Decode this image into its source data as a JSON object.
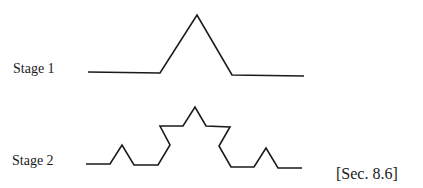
{
  "figure": {
    "stage1_label": "Stage 1",
    "stage2_label": "Stage 2",
    "section_ref": "[Sec. 8.6]",
    "stroke_color": "#1a1a1a",
    "stage1_points": "88,72 160,73 197,15 232,75 304,76",
    "stage2_points": "86,164 110,164 122,145 134,165 158,165 170,145 160,126 183,126 195,107 206,126 230,127 219,146 231,167 254,167 266,148 278,168 302,168"
  }
}
